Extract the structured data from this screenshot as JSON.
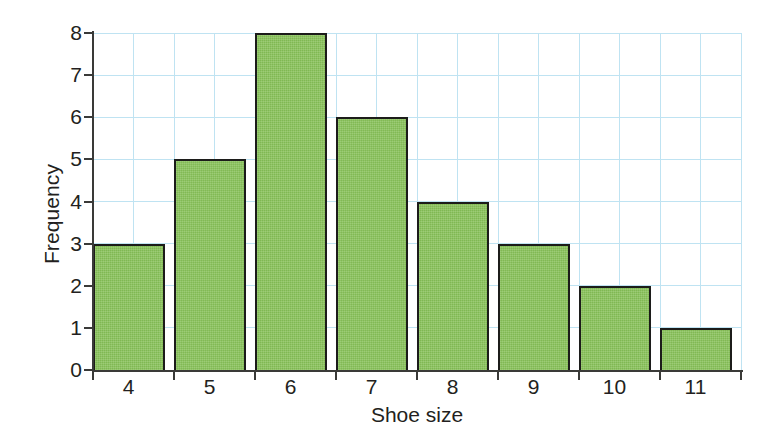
{
  "chart_data": {
    "type": "bar",
    "title": "",
    "subtitle": "",
    "xlabel": "Shoe size",
    "ylabel": "Frequency",
    "categories": [
      "4",
      "5",
      "6",
      "7",
      "8",
      "9",
      "10",
      "11"
    ],
    "values": [
      3,
      5,
      8,
      6,
      4,
      3,
      2,
      1
    ],
    "series": [
      {
        "name": "Frequency",
        "values": [
          3,
          5,
          8,
          6,
          4,
          3,
          2,
          1
        ]
      }
    ],
    "xlim": [
      3.5,
      11.5
    ],
    "ylim": [
      0,
      8
    ],
    "ytick_labels": [
      "0",
      "1",
      "2",
      "3",
      "4",
      "5",
      "6",
      "7",
      "8"
    ],
    "ytick_values": [
      0,
      1,
      2,
      3,
      4,
      5,
      6,
      7,
      8
    ],
    "xtick_labels": [
      "4",
      "5",
      "6",
      "7",
      "8",
      "9",
      "10",
      "11"
    ],
    "grid": true,
    "grid_color": "#bfe3f2",
    "grid_axis": "both",
    "legend": false,
    "legend_position": "none",
    "bar_fill_color": "#86c057",
    "bar_edge_color": "#1c1c1a",
    "axis_color": "#3a3a38",
    "text_color": "#231f20",
    "background_color": "#ffffff",
    "annotations": []
  }
}
